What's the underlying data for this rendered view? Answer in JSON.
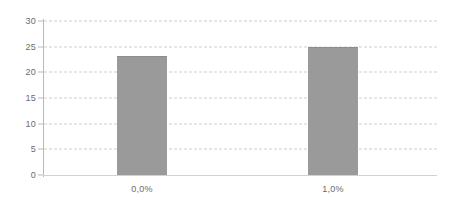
{
  "chart_data": {
    "type": "bar",
    "title": "",
    "subtitle": "",
    "xlabel": "",
    "ylabel": "",
    "categories": [
      "0,0%",
      "1,0%"
    ],
    "values": [
      23.2,
      25.0
    ],
    "series": [
      {
        "name": "",
        "values": [
          23.2,
          25.0
        ]
      }
    ],
    "ylim": [
      0,
      30
    ],
    "y_ticks": [
      0,
      5,
      10,
      15,
      20,
      25,
      30
    ],
    "y_tick_labels": [
      "0",
      "5",
      "10",
      "15",
      "20",
      "25",
      "30"
    ],
    "grid": true,
    "grid_axis": "y",
    "grid_style": "dashed",
    "legend": false,
    "legend_position": "none",
    "bar_color": "#9a9a9a",
    "grid_color": "#cfcfcf",
    "axis_color": "#b9b9b9",
    "text_color": "#6b6b6b",
    "background_color": "#ffffff"
  },
  "axes": {
    "y": {
      "ticks": [
        {
          "label": "30",
          "value": 30
        },
        {
          "label": "25",
          "value": 25
        },
        {
          "label": "20",
          "value": 20
        },
        {
          "label": "15",
          "value": 15
        },
        {
          "label": "10",
          "value": 10
        },
        {
          "label": "5",
          "value": 5
        },
        {
          "label": "0",
          "value": 0
        }
      ]
    },
    "x": {
      "ticks": [
        {
          "label": "0,0%"
        },
        {
          "label": "1,0%"
        }
      ]
    }
  }
}
